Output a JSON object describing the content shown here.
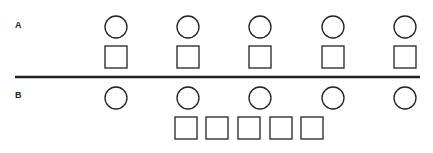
{
  "diagram": {
    "labels": {
      "a": "A",
      "b": "B"
    },
    "stroke_color": "#222222",
    "row_a": {
      "circles_x": [
        116,
        188,
        260,
        333,
        405
      ],
      "circle_y": 27,
      "squares_x": [
        116,
        188,
        260,
        333,
        405
      ],
      "square_y": 57
    },
    "divider": {
      "x1": 15,
      "x2": 420,
      "y": 77
    },
    "row_b": {
      "circles_x": [
        116,
        188,
        260,
        333,
        405
      ],
      "circle_y": 98,
      "squares_x": [
        186,
        217,
        249,
        281,
        312
      ],
      "square_y": 128
    }
  }
}
